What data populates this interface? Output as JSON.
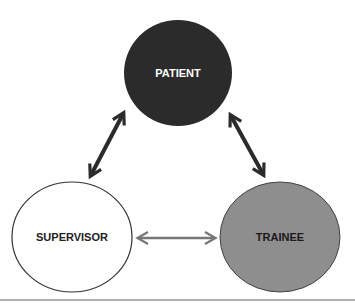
{
  "diagram": {
    "nodes": [
      {
        "id": "patient",
        "label": "PATIENT",
        "fill": "#2b2b2b",
        "text_color": "#ffffff"
      },
      {
        "id": "supervisor",
        "label": "SUPERVISOR",
        "fill": "#ffffff",
        "text_color": "#222222"
      },
      {
        "id": "trainee",
        "label": "TRAINEE",
        "fill": "#8e8e8e",
        "text_color": "#1a1a1a"
      }
    ],
    "edges": [
      {
        "from": "patient",
        "to": "supervisor",
        "bidirectional": true,
        "color": "#2b2b2b"
      },
      {
        "from": "patient",
        "to": "trainee",
        "bidirectional": true,
        "color": "#2b2b2b"
      },
      {
        "from": "supervisor",
        "to": "trainee",
        "bidirectional": true,
        "color": "#777777"
      }
    ]
  }
}
